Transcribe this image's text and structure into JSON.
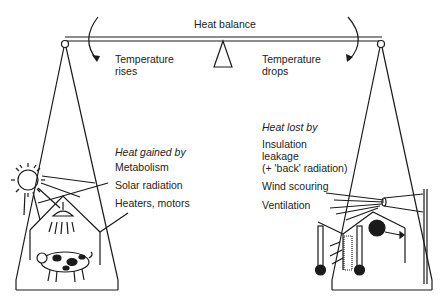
{
  "title": "Heat balance",
  "left": {
    "arrow_label_line1": "Temperature",
    "arrow_label_line2": "rises",
    "heading": "Heat gained by",
    "items": [
      "Metabolism",
      "Solar radiation",
      "Heaters, motors"
    ]
  },
  "right": {
    "arrow_label_line1": "Temperature",
    "arrow_label_line2": "drops",
    "heading": "Heat lost by",
    "items": [
      "Insulation",
      "leakage",
      "(+ 'back' radiation)",
      "Wind scouring",
      "Ventilation"
    ]
  },
  "icons": [
    "sun-icon",
    "heat-lamp-icon",
    "pig-icon",
    "fan-icon",
    "thermometer-icon",
    "wind-funnel-icon"
  ],
  "colors": {
    "ink": "#1a1a1a",
    "background": "#ffffff"
  }
}
